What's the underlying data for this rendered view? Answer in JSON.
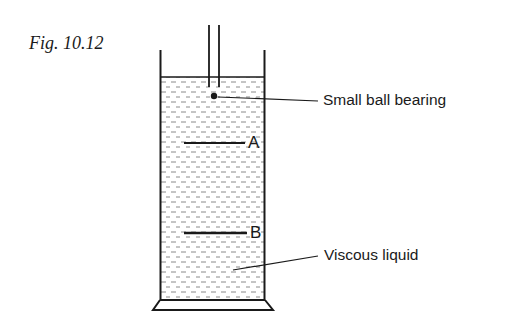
{
  "figure": {
    "title": "Fig. 10.12"
  },
  "labels": {
    "ball": "Small ball bearing",
    "mark_a": "A",
    "mark_b": "B",
    "liquid": "Viscous liquid"
  },
  "colors": {
    "ink": "#1a1a1a",
    "liquid_dash": "#8a8a8a",
    "background": "#ffffff"
  }
}
